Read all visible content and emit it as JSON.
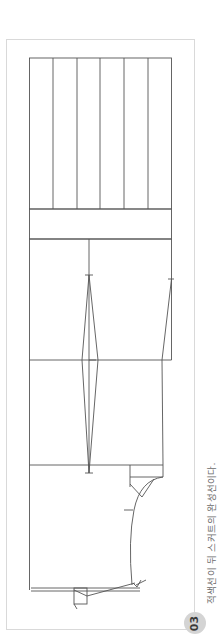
{
  "figure": {
    "step_number": "03",
    "caption": "적색선이 뒤 스커트의 완성선이다.",
    "colors": {
      "frame_border": "#d9d9d9",
      "pattern_line": "#555555",
      "badge_background": "#d4d4d4",
      "caption_text": "#6b6b6b"
    }
  }
}
